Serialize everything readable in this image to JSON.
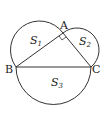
{
  "diagram": {
    "points": {
      "A": "A",
      "B": "B",
      "C": "C"
    },
    "regions": {
      "s1": {
        "base": "S",
        "sub": "1"
      },
      "s2": {
        "base": "S",
        "sub": "2"
      },
      "s3": {
        "base": "S",
        "sub": "3"
      }
    },
    "right_angle_at": "A",
    "stroke_color": "#333333"
  }
}
